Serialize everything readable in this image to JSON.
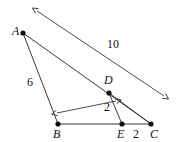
{
  "figure": {
    "type": "geometry-diagram",
    "width": 179,
    "height": 142,
    "background_color": "#ffffff",
    "stroke_color": "#3a3a3a",
    "point_color": "#111111",
    "text_color": "#111111",
    "points": [
      {
        "id": "A",
        "label": "A",
        "x": 23,
        "y": 33,
        "label_x": 12,
        "label_y": 25
      },
      {
        "id": "B",
        "label": "B",
        "x": 58,
        "y": 124,
        "label_x": 53,
        "label_y": 128
      },
      {
        "id": "C",
        "label": "C",
        "x": 151,
        "y": 124,
        "label_x": 150,
        "label_y": 128
      },
      {
        "id": "D",
        "label": "D",
        "x": 109,
        "y": 93,
        "label_x": 104,
        "label_y": 74
      },
      {
        "id": "E",
        "label": "E",
        "x": 122,
        "y": 124,
        "label_x": 117,
        "label_y": 128
      }
    ],
    "segments": [
      {
        "id": "AB",
        "from": "A",
        "to": "B"
      },
      {
        "id": "AC",
        "from": "A",
        "to": "C"
      },
      {
        "id": "BC",
        "from": "B",
        "to": "C"
      },
      {
        "id": "DE",
        "from": "D",
        "to": "E"
      },
      {
        "id": "DC",
        "from": "D",
        "to": "C"
      }
    ],
    "dimensions": [
      {
        "id": "dim-10",
        "label": "10",
        "label_x": 107,
        "label_y": 38,
        "x1": 37,
        "y1": 11,
        "x2": 164,
        "y2": 96,
        "arrows": "both"
      },
      {
        "id": "dim-2-upper",
        "label": "2",
        "label_x": 104,
        "label_y": 101,
        "x1": 57,
        "y1": 113,
        "x2": 116,
        "y2": 101,
        "arrows": "both"
      }
    ],
    "side_labels": [
      {
        "id": "len-AB",
        "label": "6",
        "x": 27,
        "y": 76
      },
      {
        "id": "len-EC",
        "label": "2",
        "x": 133,
        "y": 128
      }
    ]
  }
}
